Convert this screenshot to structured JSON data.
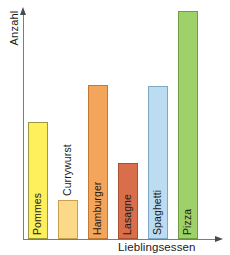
{
  "chart_data": {
    "type": "bar",
    "title": "",
    "xlabel": "Lieblingsessen",
    "ylabel": "Anzahl",
    "categories": [
      "Pommes",
      "Currywurst",
      "Hamburger",
      "Lasagne",
      "Spaghetti",
      "Pizza"
    ],
    "values": [
      117,
      39,
      154,
      76,
      153,
      228
    ],
    "value_unit": "pixel-height",
    "ylim": [
      0,
      240
    ],
    "grid": false,
    "legend": null,
    "axis_style": "arrow",
    "tick_labels_x": [],
    "tick_labels_y": [],
    "bars": [
      {
        "label": "Pommes",
        "value": 117,
        "color": "#fdf05c",
        "border": "#9a9a3d",
        "label_color": "#1a1a1a",
        "label_inside": true
      },
      {
        "label": "Currywurst",
        "value": 39,
        "color": "#fbd988",
        "border": "#c9a14e",
        "label_color": "#1a1a1a",
        "label_inside": false
      },
      {
        "label": "Hamburger",
        "value": 154,
        "color": "#f4a55c",
        "border": "#c07a33",
        "label_color": "#1a1a1a",
        "label_inside": true
      },
      {
        "label": "Lasagne",
        "value": 76,
        "color": "#d96f4a",
        "border": "#a8502f",
        "label_color": "#1a1a1a",
        "label_inside": true
      },
      {
        "label": "Spaghetti",
        "value": 153,
        "color": "#bcdcf2",
        "border": "#7fa8c4",
        "label_color": "#1a1a1a",
        "label_inside": true
      },
      {
        "label": "Pizza",
        "value": 228,
        "color": "#9ed16a",
        "border": "#6f9e42",
        "label_color": "#1a1a1a",
        "label_inside": true
      }
    ]
  },
  "axes": {
    "y_title": "Anzahl",
    "x_title": "Lieblingsessen"
  }
}
